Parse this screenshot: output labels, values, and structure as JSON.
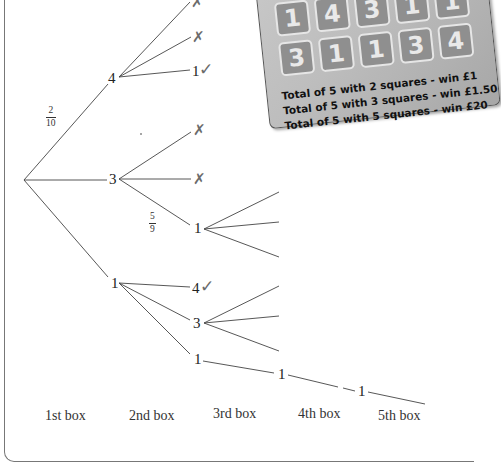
{
  "scratch_card": {
    "squares": [
      "1",
      "4",
      "3",
      "1",
      "1",
      "3",
      "1",
      "1",
      "3",
      "4"
    ],
    "rules": [
      "Total of 5 with 2 squares - win £1",
      "Total of 5 with 3 squares - win £1.50",
      "Total of 5 with 5 squares - win £20"
    ]
  },
  "tree": {
    "fractions": {
      "first": {
        "num": "2",
        "den": "10"
      },
      "second": {
        "num": "5",
        "den": "9"
      }
    },
    "box2": {
      "top": "4",
      "mid": "3",
      "bot": "1"
    },
    "box3": {
      "from4": {
        "a": "",
        "b": "",
        "c": "1"
      },
      "from3": {
        "c": "1"
      },
      "from1": {
        "a": "4",
        "b": "3",
        "c": "1"
      }
    },
    "box4": {
      "node": "1"
    },
    "box5": {
      "node": "1"
    },
    "marks": {
      "cross": "✗",
      "tick": "✓"
    }
  },
  "axis_labels": [
    "1st box",
    "2nd box",
    "3rd box",
    "4th box",
    "5th box"
  ]
}
